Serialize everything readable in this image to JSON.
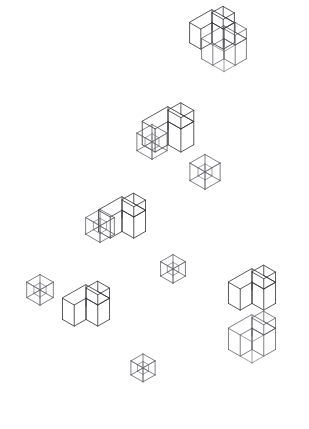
{
  "meta": {
    "canvas": {
      "width": 309,
      "height": 429
    },
    "background_color": "#ffffff",
    "line_color": "#2e2e33",
    "wire_color": "#4a4a52",
    "faint_color": "#6d6d75"
  },
  "figure": {
    "projection": "isometric",
    "unit": {
      "dx": 11.2,
      "dy": 6.4,
      "dz": 13.0
    },
    "groups": [
      {
        "id": "group-top-right",
        "label": "Top right pair",
        "origin": {
          "x": 218,
          "y": 52
        },
        "members": [
          {
            "type": "z-block-solid",
            "name": "solid-z-block",
            "x": 212,
            "y": 30,
            "scale": 1.0
          },
          {
            "type": "z-block-wire",
            "name": "wire-z-block",
            "x": 224,
            "y": 46,
            "scale": 1.0
          }
        ]
      },
      {
        "id": "group-upper-middle",
        "label": "Upper middle cluster",
        "origin": {
          "x": 172,
          "y": 158
        },
        "members": [
          {
            "type": "z-block-solid",
            "name": "solid-z-block",
            "x": 168,
            "y": 130,
            "scale": 1.15
          },
          {
            "type": "cube-wire",
            "name": "wire-cube",
            "x": 152,
            "y": 142,
            "scale": 1.0
          },
          {
            "type": "cube-wire",
            "name": "wire-cube",
            "x": 205,
            "y": 172,
            "scale": 1.0
          }
        ]
      },
      {
        "id": "group-center",
        "label": "Center cluster",
        "origin": {
          "x": 123,
          "y": 243
        },
        "members": [
          {
            "type": "z-block-solid",
            "name": "solid-z-block",
            "x": 122,
            "y": 218,
            "scale": 1.05
          },
          {
            "type": "cube-wire",
            "name": "wire-cube",
            "x": 100,
            "y": 226,
            "scale": 0.95
          },
          {
            "type": "cube-wire",
            "name": "wire-cube",
            "x": 173,
            "y": 269,
            "scale": 0.82
          }
        ]
      },
      {
        "id": "group-left",
        "label": "Left small cube",
        "origin": {
          "x": 40,
          "y": 290
        },
        "members": [
          {
            "type": "cube-wire",
            "name": "wire-cube",
            "x": 40,
            "y": 290,
            "scale": 0.88
          }
        ]
      },
      {
        "id": "group-bottom-left",
        "label": "Bottom left block",
        "origin": {
          "x": 85,
          "y": 330
        },
        "members": [
          {
            "type": "z-block-solid",
            "name": "solid-z-block",
            "x": 86,
            "y": 306,
            "scale": 1.05
          }
        ]
      },
      {
        "id": "group-bottom-center",
        "label": "Bottom centre cube",
        "origin": {
          "x": 143,
          "y": 368
        },
        "members": [
          {
            "type": "cube-wire",
            "name": "wire-cube",
            "x": 143,
            "y": 368,
            "scale": 0.8
          }
        ]
      },
      {
        "id": "group-bottom-right",
        "label": "Bottom right stack",
        "origin": {
          "x": 257,
          "y": 318
        },
        "members": [
          {
            "type": "z-block-solid",
            "name": "solid-z-block",
            "x": 252,
            "y": 290,
            "scale": 1.05
          },
          {
            "type": "z-block-wire",
            "name": "wire-z-block",
            "x": 252,
            "y": 336,
            "scale": 1.05
          }
        ]
      }
    ],
    "counts": {
      "solid_blocks": 5,
      "wire_blocks": 2,
      "wire_cubes": 5,
      "total_figures": 12
    }
  }
}
